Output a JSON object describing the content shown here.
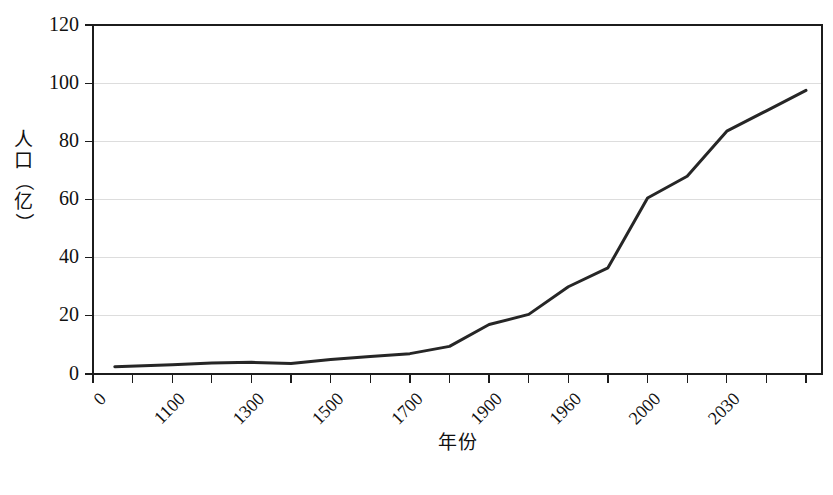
{
  "chart_data": {
    "type": "line",
    "title": "",
    "xlabel": "年份",
    "ylabel": "人口（亿）",
    "ylim": [
      0,
      120
    ],
    "grid": true,
    "legend": false,
    "y_ticks": [
      0,
      20,
      40,
      60,
      80,
      100,
      120
    ],
    "x_tick_labels": [
      "0",
      "1100",
      "1300",
      "1500",
      "1700",
      "1900",
      "1960",
      "2000",
      "2030"
    ],
    "x_tick_count": 19,
    "x_labeled_tick_indices": [
      0,
      2,
      4,
      6,
      8,
      10,
      12,
      14,
      16
    ],
    "x": [
      "0",
      "1100",
      "1300",
      "1500",
      "1700",
      "1900",
      "1960",
      "2000",
      "2030"
    ],
    "series": [
      {
        "name": "世界人口",
        "points": [
          {
            "tick": 0.55,
            "year": "0",
            "value": 2.5
          },
          {
            "tick": 2.0,
            "year": "1100",
            "value": 3.2
          },
          {
            "tick": 3.0,
            "year": "1200",
            "value": 3.8
          },
          {
            "tick": 4.0,
            "year": "1300",
            "value": 4.0
          },
          {
            "tick": 5.0,
            "year": "1400",
            "value": 3.6
          },
          {
            "tick": 6.0,
            "year": "1500",
            "value": 5.0
          },
          {
            "tick": 7.0,
            "year": "1600",
            "value": 6.0
          },
          {
            "tick": 8.0,
            "year": "1700",
            "value": 7.0
          },
          {
            "tick": 9.0,
            "year": "1800",
            "value": 9.5
          },
          {
            "tick": 10.0,
            "year": "1900",
            "value": 17.0
          },
          {
            "tick": 11.0,
            "year": "1930",
            "value": 20.5
          },
          {
            "tick": 12.0,
            "year": "1960",
            "value": 30.0
          },
          {
            "tick": 13.0,
            "year": "1980",
            "value": 36.5
          },
          {
            "tick": 14.0,
            "year": "2000",
            "value": 60.5
          },
          {
            "tick": 15.0,
            "year": "2010",
            "value": 68.0
          },
          {
            "tick": 16.0,
            "year": "2030",
            "value": 83.5
          },
          {
            "tick": 17.0,
            "year": "2040",
            "value": 90.5
          },
          {
            "tick": 18.0,
            "year": "2050",
            "value": 97.5
          }
        ]
      }
    ]
  },
  "axis": {
    "y_title_chars": [
      "人",
      "口",
      "（",
      "亿",
      "）"
    ],
    "x_title": "年份"
  }
}
